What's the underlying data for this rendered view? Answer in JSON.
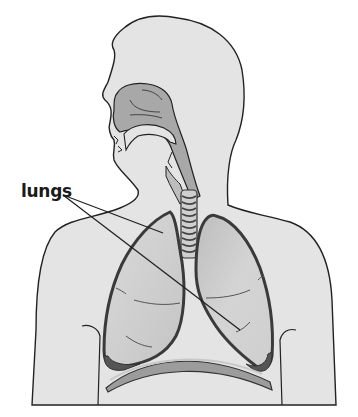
{
  "figure": {
    "labels": [
      {
        "id": "lungs",
        "text": "lungs",
        "x": 21,
        "y": 181
      }
    ]
  },
  "colors": {
    "background": "#ffffff",
    "body_fill": "#e4e4e4",
    "airway_fill": "#a8a8a8",
    "lung_fill": "#d2d2d2",
    "lung_outline": "#3a3a3a",
    "diaphragm_fill": "#9c9c9c",
    "outline": "#222222"
  }
}
